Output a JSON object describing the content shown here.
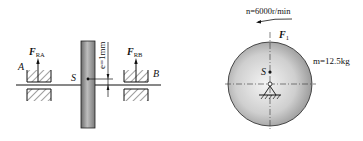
{
  "left_figure": {
    "bearing_a": {
      "label": "A",
      "force_symbol": "F",
      "force_subscript": "RA"
    },
    "bearing_b": {
      "label": "B",
      "force_symbol": "F",
      "force_subscript": "RB"
    },
    "center_of_mass_label": "S",
    "eccentricity_label": "e=1mm"
  },
  "right_figure": {
    "speed_label": "n=6000r/min",
    "force_symbol": "F",
    "force_subscript": "1",
    "mass_label": "m=12.5kg",
    "center_of_mass_label": "S"
  },
  "colors": {
    "line": "#111111",
    "disc_dark": "#6e6e6e",
    "disc_light": "#e6e6e6",
    "circle_light": "#f2f2f2",
    "circle_dark": "#9a9a9a"
  }
}
